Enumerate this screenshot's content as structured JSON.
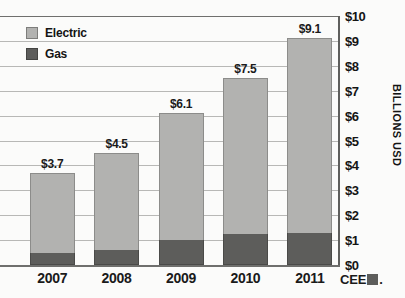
{
  "chart_data": {
    "type": "bar",
    "title": "",
    "subtitle": "",
    "xlabel": "",
    "ylabel": "BILLIONS USD",
    "categories": [
      "2007",
      "2008",
      "2009",
      "2010",
      "2011"
    ],
    "ylim": [
      0,
      10
    ],
    "ytick_labels": [
      "$0",
      "$1",
      "$2",
      "$3",
      "$4",
      "$5",
      "$6",
      "$7",
      "$8",
      "$9",
      "$10"
    ],
    "ytick_values": [
      0,
      1,
      2,
      3,
      4,
      5,
      6,
      7,
      8,
      9,
      10
    ],
    "grid": true,
    "stacked": true,
    "legend_position": "top-left",
    "series": [
      {
        "name": "Gas",
        "color": "#5d5d5b",
        "values": [
          0.5,
          0.6,
          1.0,
          1.25,
          1.3
        ]
      },
      {
        "name": "Electric",
        "color": "#b2b2b0",
        "values": [
          3.2,
          3.9,
          5.1,
          6.25,
          7.8
        ]
      }
    ],
    "totals": [
      3.7,
      4.5,
      6.1,
      7.5,
      9.1
    ],
    "data_labels": [
      "$3.7",
      "$4.5",
      "$6.1",
      "$7.5",
      "$9.1"
    ]
  },
  "legend": {
    "items": [
      {
        "label": "Electric",
        "swatch": "electric"
      },
      {
        "label": "Gas",
        "swatch": "gas"
      }
    ]
  },
  "logo": {
    "text": "CEE",
    "dot": "."
  }
}
